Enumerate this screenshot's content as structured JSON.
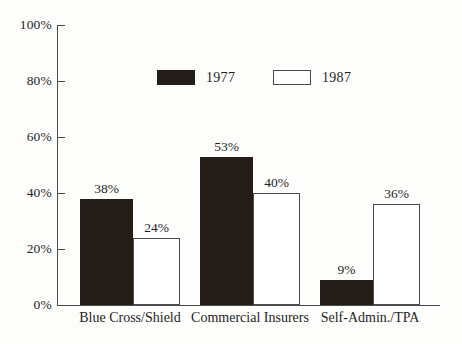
{
  "chart_data": {
    "type": "bar",
    "title": "",
    "xlabel": "",
    "ylabel": "",
    "ylim": [
      0,
      100
    ],
    "yticks": [
      "0%",
      "20%",
      "40%",
      "60%",
      "80%",
      "100%"
    ],
    "ytick_values": [
      0,
      20,
      40,
      60,
      80,
      100
    ],
    "grid": false,
    "legend_position": "top-center",
    "categories": [
      "Blue Cross/Shield",
      "Commercial Insurers",
      "Self-Admin./TPA"
    ],
    "series": [
      {
        "name": "1977",
        "color": "#241c17",
        "style": "filled",
        "values": [
          38,
          53,
          9
        ],
        "labels": [
          "38%",
          "53%",
          "9%"
        ]
      },
      {
        "name": "1987",
        "color": "#ffffff",
        "style": "outlined",
        "values": [
          24,
          40,
          36
        ],
        "labels": [
          "24%",
          "40%",
          "36%"
        ]
      }
    ]
  },
  "legend": {
    "entries": [
      {
        "label": "1977",
        "swatch": "filled-black-swatch"
      },
      {
        "label": "1987",
        "swatch": "outlined-white-swatch"
      }
    ]
  },
  "axes": {
    "y_tick_labels": [
      "100%",
      "80%",
      "60%",
      "40%",
      "20%",
      "0%"
    ],
    "x_tick_labels": [
      "Blue Cross/Shield",
      "Commercial Insurers",
      "Self-Admin./TPA"
    ]
  },
  "colors": {
    "series_1977": "#241c17",
    "series_1987": "#ffffff",
    "axis": "#4a4a4a",
    "text": "#1f1f1f",
    "background": "#fdfdfc"
  }
}
